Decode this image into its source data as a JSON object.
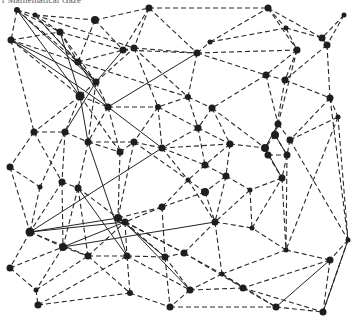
{
  "caption": "r Mathematical Gaze",
  "graph": {
    "node_color": "#1e1e1e",
    "edge_color": "#2a2a2a",
    "nodes": [
      {
        "id": 0,
        "x": 17,
        "y": 10,
        "r": 3
      },
      {
        "id": 1,
        "x": 35,
        "y": 15,
        "r": 2.5
      },
      {
        "id": 2,
        "x": 95,
        "y": 20,
        "r": 4
      },
      {
        "id": 3,
        "x": 11,
        "y": 40,
        "r": 3.5
      },
      {
        "id": 4,
        "x": 60,
        "y": 32,
        "r": 3.5
      },
      {
        "id": 5,
        "x": 78,
        "y": 62,
        "r": 3.5
      },
      {
        "id": 6,
        "x": 96,
        "y": 82,
        "r": 3.5
      },
      {
        "id": 7,
        "x": 80,
        "y": 96,
        "r": 4.5
      },
      {
        "id": 8,
        "x": 108,
        "y": 107,
        "r": 3.5
      },
      {
        "id": 9,
        "x": 149,
        "y": 8,
        "r": 3.5
      },
      {
        "id": 10,
        "x": 123,
        "y": 50,
        "r": 3.5
      },
      {
        "id": 11,
        "x": 134,
        "y": 48,
        "r": 3.5
      },
      {
        "id": 12,
        "x": 197,
        "y": 53,
        "r": 3.5
      },
      {
        "id": 13,
        "x": 210,
        "y": 42,
        "r": 2.5
      },
      {
        "id": 14,
        "x": 268,
        "y": 8,
        "r": 3.5
      },
      {
        "id": 15,
        "x": 344,
        "y": 15,
        "r": 2.5
      },
      {
        "id": 16,
        "x": 286,
        "y": 28,
        "r": 2.5
      },
      {
        "id": 17,
        "x": 322,
        "y": 38,
        "r": 3.5
      },
      {
        "id": 18,
        "x": 327,
        "y": 45,
        "r": 3.5
      },
      {
        "id": 19,
        "x": 297,
        "y": 50,
        "r": 3.5
      },
      {
        "id": 20,
        "x": 266,
        "y": 75,
        "r": 3.5
      },
      {
        "id": 21,
        "x": 285,
        "y": 80,
        "r": 3.5
      },
      {
        "id": 22,
        "x": 330,
        "y": 98,
        "r": 3.5
      },
      {
        "id": 23,
        "x": 188,
        "y": 97,
        "r": 3
      },
      {
        "id": 24,
        "x": 158,
        "y": 107,
        "r": 3
      },
      {
        "id": 25,
        "x": 212,
        "y": 108,
        "r": 3.5
      },
      {
        "id": 26,
        "x": 198,
        "y": 128,
        "r": 3.5
      },
      {
        "id": 27,
        "x": 34,
        "y": 132,
        "r": 3.5
      },
      {
        "id": 28,
        "x": 65,
        "y": 132,
        "r": 3.5
      },
      {
        "id": 29,
        "x": 88,
        "y": 142,
        "r": 3.5
      },
      {
        "id": 30,
        "x": 10,
        "y": 167,
        "r": 3.5
      },
      {
        "id": 31,
        "x": 120,
        "y": 152,
        "r": 3.5
      },
      {
        "id": 32,
        "x": 134,
        "y": 142,
        "r": 3.5
      },
      {
        "id": 33,
        "x": 162,
        "y": 148,
        "r": 3.5
      },
      {
        "id": 34,
        "x": 230,
        "y": 144,
        "r": 3.5
      },
      {
        "id": 35,
        "x": 205,
        "y": 165,
        "r": 3.5
      },
      {
        "id": 36,
        "x": 226,
        "y": 176,
        "r": 3.5
      },
      {
        "id": 37,
        "x": 188,
        "y": 180,
        "r": 2.5
      },
      {
        "id": 38,
        "x": 205,
        "y": 192,
        "r": 4
      },
      {
        "id": 39,
        "x": 162,
        "y": 207,
        "r": 3.5
      },
      {
        "id": 40,
        "x": 278,
        "y": 124,
        "r": 3.5
      },
      {
        "id": 41,
        "x": 275,
        "y": 135,
        "r": 4
      },
      {
        "id": 42,
        "x": 290,
        "y": 140,
        "r": 3.5
      },
      {
        "id": 43,
        "x": 265,
        "y": 148,
        "r": 4
      },
      {
        "id": 44,
        "x": 268,
        "y": 155,
        "r": 3.5
      },
      {
        "id": 45,
        "x": 287,
        "y": 155,
        "r": 3.5
      },
      {
        "id": 46,
        "x": 282,
        "y": 178,
        "r": 3.5
      },
      {
        "id": 47,
        "x": 338,
        "y": 117,
        "r": 2.5
      },
      {
        "id": 48,
        "x": 250,
        "y": 190,
        "r": 2.5
      },
      {
        "id": 49,
        "x": 62,
        "y": 182,
        "r": 3.5
      },
      {
        "id": 50,
        "x": 78,
        "y": 188,
        "r": 3.5
      },
      {
        "id": 51,
        "x": 40,
        "y": 187,
        "r": 2.5
      },
      {
        "id": 52,
        "x": 30,
        "y": 232,
        "r": 4.5
      },
      {
        "id": 53,
        "x": 63,
        "y": 247,
        "r": 4
      },
      {
        "id": 54,
        "x": 88,
        "y": 256,
        "r": 3.5
      },
      {
        "id": 55,
        "x": 10,
        "y": 268,
        "r": 3.5
      },
      {
        "id": 56,
        "x": 36,
        "y": 290,
        "r": 2.5
      },
      {
        "id": 57,
        "x": 38,
        "y": 305,
        "r": 3.5
      },
      {
        "id": 58,
        "x": 118,
        "y": 218,
        "r": 4
      },
      {
        "id": 59,
        "x": 125,
        "y": 222,
        "r": 3.5
      },
      {
        "id": 60,
        "x": 127,
        "y": 256,
        "r": 3.5
      },
      {
        "id": 61,
        "x": 165,
        "y": 257,
        "r": 3.5
      },
      {
        "id": 62,
        "x": 184,
        "y": 253,
        "r": 3.5
      },
      {
        "id": 63,
        "x": 215,
        "y": 222,
        "r": 3.5
      },
      {
        "id": 64,
        "x": 222,
        "y": 274,
        "r": 2.5
      },
      {
        "id": 65,
        "x": 190,
        "y": 290,
        "r": 3.5
      },
      {
        "id": 66,
        "x": 130,
        "y": 293,
        "r": 3
      },
      {
        "id": 67,
        "x": 170,
        "y": 307,
        "r": 3.5
      },
      {
        "id": 68,
        "x": 286,
        "y": 250,
        "r": 2.5
      },
      {
        "id": 69,
        "x": 348,
        "y": 240,
        "r": 2.5
      },
      {
        "id": 70,
        "x": 330,
        "y": 260,
        "r": 3.5
      },
      {
        "id": 71,
        "x": 243,
        "y": 288,
        "r": 3.5
      },
      {
        "id": 72,
        "x": 276,
        "y": 307,
        "r": 3.5
      },
      {
        "id": 73,
        "x": 323,
        "y": 312,
        "r": 3.5
      },
      {
        "id": 74,
        "x": 252,
        "y": 228,
        "r": 2.5
      }
    ],
    "edges_dashed": [
      [
        0,
        1
      ],
      [
        0,
        3
      ],
      [
        0,
        5
      ],
      [
        0,
        4
      ],
      [
        1,
        2
      ],
      [
        1,
        4
      ],
      [
        1,
        5
      ],
      [
        2,
        9
      ],
      [
        2,
        10
      ],
      [
        2,
        5
      ],
      [
        3,
        4
      ],
      [
        3,
        27
      ],
      [
        3,
        7
      ],
      [
        3,
        5
      ],
      [
        4,
        6
      ],
      [
        4,
        5
      ],
      [
        5,
        6
      ],
      [
        5,
        10
      ],
      [
        6,
        7
      ],
      [
        6,
        11
      ],
      [
        6,
        8
      ],
      [
        7,
        8
      ],
      [
        7,
        27
      ],
      [
        7,
        28
      ],
      [
        8,
        24
      ],
      [
        8,
        29
      ],
      [
        8,
        31
      ],
      [
        9,
        10
      ],
      [
        9,
        11
      ],
      [
        9,
        14
      ],
      [
        9,
        12
      ],
      [
        10,
        11
      ],
      [
        10,
        12
      ],
      [
        11,
        12
      ],
      [
        11,
        23
      ],
      [
        12,
        13
      ],
      [
        12,
        19
      ],
      [
        12,
        20
      ],
      [
        13,
        14
      ],
      [
        13,
        16
      ],
      [
        14,
        16
      ],
      [
        14,
        17
      ],
      [
        14,
        19
      ],
      [
        15,
        17
      ],
      [
        15,
        18
      ],
      [
        16,
        17
      ],
      [
        16,
        19
      ],
      [
        17,
        18
      ],
      [
        18,
        22
      ],
      [
        18,
        21
      ],
      [
        19,
        20
      ],
      [
        19,
        21
      ],
      [
        20,
        21
      ],
      [
        20,
        25
      ],
      [
        20,
        40
      ],
      [
        21,
        22
      ],
      [
        21,
        41
      ],
      [
        22,
        47
      ],
      [
        22,
        42
      ],
      [
        23,
        24
      ],
      [
        23,
        25
      ],
      [
        23,
        26
      ],
      [
        24,
        26
      ],
      [
        24,
        32
      ],
      [
        24,
        33
      ],
      [
        25,
        26
      ],
      [
        25,
        34
      ],
      [
        26,
        33
      ],
      [
        26,
        35
      ],
      [
        27,
        28
      ],
      [
        27,
        30
      ],
      [
        27,
        49
      ],
      [
        28,
        29
      ],
      [
        28,
        49
      ],
      [
        29,
        31
      ],
      [
        29,
        32
      ],
      [
        29,
        50
      ],
      [
        30,
        51
      ],
      [
        30,
        52
      ],
      [
        31,
        32
      ],
      [
        31,
        58
      ],
      [
        32,
        33
      ],
      [
        32,
        37
      ],
      [
        33,
        34
      ],
      [
        33,
        37
      ],
      [
        34,
        35
      ],
      [
        34,
        36
      ],
      [
        34,
        43
      ],
      [
        35,
        36
      ],
      [
        35,
        37
      ],
      [
        36,
        38
      ],
      [
        36,
        48
      ],
      [
        37,
        38
      ],
      [
        37,
        39
      ],
      [
        38,
        39
      ],
      [
        38,
        63
      ],
      [
        39,
        58
      ],
      [
        39,
        59
      ],
      [
        39,
        61
      ],
      [
        40,
        41
      ],
      [
        40,
        42
      ],
      [
        41,
        43
      ],
      [
        41,
        45
      ],
      [
        42,
        45
      ],
      [
        42,
        47
      ],
      [
        43,
        44
      ],
      [
        44,
        45
      ],
      [
        44,
        46
      ],
      [
        45,
        46
      ],
      [
        46,
        48
      ],
      [
        46,
        68
      ],
      [
        47,
        69
      ],
      [
        48,
        63
      ],
      [
        48,
        74
      ],
      [
        49,
        50
      ],
      [
        49,
        52
      ],
      [
        50,
        58
      ],
      [
        50,
        53
      ],
      [
        51,
        52
      ],
      [
        52,
        53
      ],
      [
        52,
        54
      ],
      [
        52,
        55
      ],
      [
        53,
        54
      ],
      [
        53,
        56
      ],
      [
        54,
        60
      ],
      [
        54,
        59
      ],
      [
        55,
        56
      ],
      [
        55,
        53
      ],
      [
        56,
        57
      ],
      [
        56,
        54
      ],
      [
        57,
        66
      ],
      [
        58,
        59
      ],
      [
        59,
        60
      ],
      [
        59,
        61
      ],
      [
        60,
        61
      ],
      [
        60,
        66
      ],
      [
        61,
        62
      ],
      [
        61,
        65
      ],
      [
        62,
        63
      ],
      [
        62,
        64
      ],
      [
        63,
        74
      ],
      [
        63,
        64
      ],
      [
        64,
        65
      ],
      [
        64,
        68
      ],
      [
        64,
        71
      ],
      [
        65,
        67
      ],
      [
        65,
        71
      ],
      [
        66,
        67
      ],
      [
        67,
        72
      ],
      [
        68,
        70
      ],
      [
        68,
        74
      ],
      [
        69,
        70
      ],
      [
        69,
        73
      ],
      [
        70,
        73
      ],
      [
        70,
        71
      ],
      [
        71,
        72
      ],
      [
        72,
        73
      ],
      [
        74,
        46
      ],
      [
        60,
        65
      ],
      [
        36,
        63
      ],
      [
        1,
        11
      ],
      [
        4,
        10
      ],
      [
        5,
        23
      ],
      [
        11,
        24
      ],
      [
        12,
        23
      ],
      [
        19,
        40
      ],
      [
        25,
        43
      ],
      [
        33,
        35
      ],
      [
        26,
        34
      ],
      [
        45,
        68
      ],
      [
        42,
        69
      ],
      [
        22,
        69
      ],
      [
        47,
        68
      ],
      [
        6,
        29
      ],
      [
        7,
        31
      ],
      [
        28,
        51
      ],
      [
        49,
        53
      ],
      [
        50,
        54
      ],
      [
        58,
        62
      ],
      [
        59,
        62
      ],
      [
        32,
        58
      ],
      [
        37,
        63
      ],
      [
        54,
        66
      ],
      [
        57,
        60
      ],
      [
        64,
        72
      ],
      [
        71,
        73
      ],
      [
        61,
        67
      ],
      [
        62,
        71
      ]
    ],
    "edges_solid": [
      [
        0,
        6
      ],
      [
        0,
        7
      ],
      [
        3,
        6
      ],
      [
        3,
        8
      ],
      [
        1,
        6
      ],
      [
        5,
        8
      ],
      [
        4,
        7
      ],
      [
        7,
        29
      ],
      [
        8,
        33
      ],
      [
        8,
        12
      ],
      [
        6,
        10
      ],
      [
        6,
        28
      ],
      [
        29,
        60
      ],
      [
        52,
        58
      ],
      [
        52,
        59
      ],
      [
        52,
        33
      ],
      [
        53,
        59
      ],
      [
        53,
        63
      ],
      [
        59,
        65
      ],
      [
        41,
        45
      ],
      [
        40,
        43
      ],
      [
        43,
        46
      ],
      [
        69,
        73
      ],
      [
        70,
        72
      ],
      [
        50,
        60
      ],
      [
        58,
        61
      ]
    ]
  }
}
